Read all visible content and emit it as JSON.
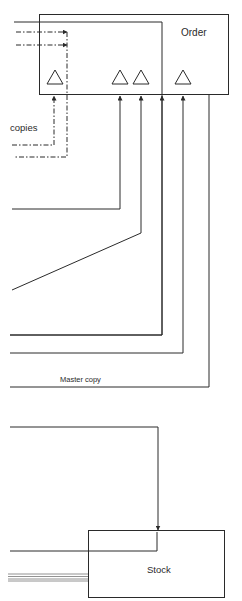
{
  "diagram": {
    "boxes": {
      "order": {
        "label": "Order"
      },
      "stock": {
        "label": "Stock"
      }
    },
    "labels": {
      "copies": "copies",
      "master_copy": "Master copy"
    },
    "colors": {
      "line": "#2a2a2a",
      "background": "#ffffff"
    }
  }
}
